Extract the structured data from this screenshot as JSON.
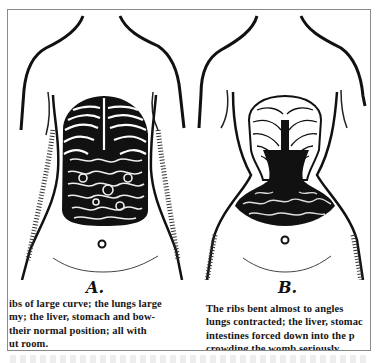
{
  "figure": {
    "panels": [
      {
        "id": "A",
        "label": "A.",
        "illustration": "natural-torso-anatomy",
        "caption_lines": [
          "ibs of large curve; the lungs large",
          "my; the liver, stomach and bow-",
          "their  normal  position;  all with",
          "ut room."
        ]
      },
      {
        "id": "B",
        "label": "B.",
        "illustration": "corseted-torso-anatomy",
        "caption_lines": [
          "The ribs bent  almost  to angles",
          "lungs contracted; the liver, stomac",
          "intestines  forced  down into  the p",
          "crowding the womb seriously."
        ]
      }
    ]
  },
  "colors": {
    "ink": "#111111",
    "paper": "#ffffff",
    "frame": "#8a8a8a"
  }
}
